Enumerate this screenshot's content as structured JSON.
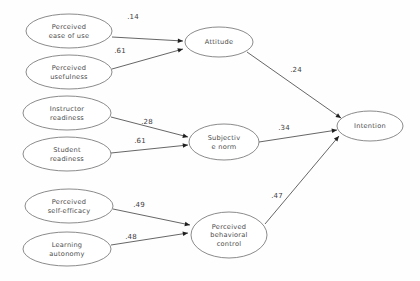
{
  "diagram": {
    "type": "path-diagram",
    "background_color": "#fefefe",
    "node_fill": "#ffffff",
    "node_stroke": "#6d6d6d",
    "edge_color": "#4a4a4a",
    "nodes": [
      {
        "id": "perceived_ease_of_use",
        "lines": [
          "Perceived",
          "ease of use"
        ],
        "cx": 69,
        "cy": 31,
        "rx": 43,
        "ry": 17
      },
      {
        "id": "perceived_usefulness",
        "lines": [
          "Perceived",
          "usefulness"
        ],
        "cx": 69,
        "cy": 72,
        "rx": 43,
        "ry": 17
      },
      {
        "id": "instructor_readiness",
        "lines": [
          "Instructor",
          "readiness"
        ],
        "cx": 67,
        "cy": 113,
        "rx": 44,
        "ry": 17
      },
      {
        "id": "student_readiness",
        "lines": [
          "Student",
          "readiness"
        ],
        "cx": 67,
        "cy": 154,
        "rx": 44,
        "ry": 17
      },
      {
        "id": "perceived_self_efficacy",
        "lines": [
          "Perceived",
          "self-efficacy"
        ],
        "cx": 69,
        "cy": 206,
        "rx": 44,
        "ry": 17
      },
      {
        "id": "learning_autonomy",
        "lines": [
          "Learning",
          "autonomy"
        ],
        "cx": 67,
        "cy": 249,
        "rx": 44,
        "ry": 17
      },
      {
        "id": "attitude",
        "lines": [
          "Attitude"
        ],
        "cx": 219,
        "cy": 42,
        "rx": 34,
        "ry": 15
      },
      {
        "id": "subjective_norm",
        "lines": [
          "Subjectiv",
          "e norm"
        ],
        "cx": 224,
        "cy": 142,
        "rx": 35,
        "ry": 18
      },
      {
        "id": "perceived_behavioral_control",
        "lines": [
          "Perceived",
          "behavioral",
          "control"
        ],
        "cx": 229,
        "cy": 235,
        "rx": 38,
        "ry": 23
      },
      {
        "id": "intention",
        "lines": [
          "Intention"
        ],
        "cx": 370,
        "cy": 126,
        "rx": 33,
        "ry": 15
      }
    ],
    "edges": [
      {
        "id": "peou_to_attitude",
        "from": "perceived_ease_of_use",
        "to": "attitude",
        "coefficient": ".14",
        "label_x": 133,
        "label_y": 19,
        "x1": 112,
        "y1": 37,
        "x2": 183,
        "y2": 41
      },
      {
        "id": "pu_to_attitude",
        "from": "perceived_usefulness",
        "to": "attitude",
        "coefficient": ".61",
        "label_x": 120,
        "label_y": 53,
        "x1": 112,
        "y1": 69,
        "x2": 183,
        "y2": 49
      },
      {
        "id": "ir_to_subjective_norm",
        "from": "instructor_readiness",
        "to": "subjective_norm",
        "coefficient": ".28",
        "label_x": 147,
        "label_y": 124,
        "x1": 111,
        "y1": 117,
        "x2": 188,
        "y2": 137
      },
      {
        "id": "sr_to_subjective_norm",
        "from": "student_readiness",
        "to": "subjective_norm",
        "coefficient": ".61",
        "label_x": 140,
        "label_y": 143,
        "x1": 111,
        "y1": 153,
        "x2": 188,
        "y2": 145
      },
      {
        "id": "pse_to_pbc",
        "from": "perceived_self_efficacy",
        "to": "perceived_behavioral_control",
        "coefficient": ".49",
        "label_x": 139,
        "label_y": 207,
        "x1": 113,
        "y1": 209,
        "x2": 190,
        "y2": 225
      },
      {
        "id": "la_to_pbc",
        "from": "learning_autonomy",
        "to": "perceived_behavioral_control",
        "coefficient": ".48",
        "label_x": 131,
        "label_y": 239,
        "x1": 111,
        "y1": 245,
        "x2": 188,
        "y2": 233
      },
      {
        "id": "attitude_to_intention",
        "from": "attitude",
        "to": "intention",
        "coefficient": ".24",
        "label_x": 296,
        "label_y": 72,
        "x1": 247,
        "y1": 52,
        "x2": 341,
        "y2": 118
      },
      {
        "id": "subjective_norm_to_intention",
        "from": "subjective_norm",
        "to": "intention",
        "coefficient": ".34",
        "label_x": 284,
        "label_y": 130,
        "x1": 259,
        "y1": 142,
        "x2": 337,
        "y2": 130
      },
      {
        "id": "pbc_to_intention",
        "from": "perceived_behavioral_control",
        "to": "intention",
        "coefficient": ".47",
        "label_x": 277,
        "label_y": 198,
        "x1": 265,
        "y1": 224,
        "x2": 339,
        "y2": 136
      }
    ]
  }
}
